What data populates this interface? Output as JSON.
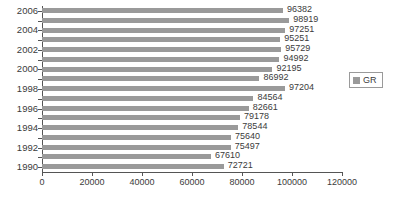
{
  "chart_data": {
    "type": "bar",
    "orientation": "horizontal",
    "title": "",
    "xlabel": "",
    "ylabel": "",
    "xlim": [
      0,
      120000
    ],
    "xticks": [
      0,
      20000,
      40000,
      60000,
      80000,
      100000,
      120000
    ],
    "xtick_labels": [
      "0",
      "20000",
      "40000",
      "60000",
      "80000",
      "100000",
      "120000"
    ],
    "grid": false,
    "categories": [
      "2006",
      "2005",
      "2004",
      "2003",
      "2002",
      "2001",
      "2000",
      "1999",
      "1998",
      "1997",
      "1996",
      "1995",
      "1994",
      "1993",
      "1992",
      "1991",
      "1990"
    ],
    "visible_category_labels": [
      "2006",
      "",
      "2004",
      "",
      "2002",
      "",
      "2000",
      "",
      "1998",
      "",
      "1996",
      "",
      "1994",
      "",
      "1992",
      "",
      "1990"
    ],
    "series": [
      {
        "name": "GR",
        "color": "#9a9a9a",
        "values": [
          96382,
          98919,
          97251,
          95251,
          95729,
          94992,
          92195,
          86992,
          97204,
          84564,
          82661,
          79178,
          78544,
          75640,
          75497,
          67610,
          72721
        ],
        "data_labels": [
          "96382",
          "98919",
          "97251",
          "95251",
          "95729",
          "94992",
          "92195",
          "86992",
          "97204",
          "84564",
          "82661",
          "79178",
          "78544",
          "75640",
          "75497",
          "67610",
          "72721"
        ]
      }
    ],
    "legend": {
      "position": "right",
      "entries": [
        {
          "label": "GR",
          "color": "#9a9a9a",
          "swatch_name": "legend-swatch-gr"
        }
      ]
    },
    "colors": {
      "bar": "#9a9a9a",
      "axis": "#555555",
      "text": "#3b3b3b",
      "background": "#ffffff",
      "legend_border": "#9a9a9a"
    }
  }
}
